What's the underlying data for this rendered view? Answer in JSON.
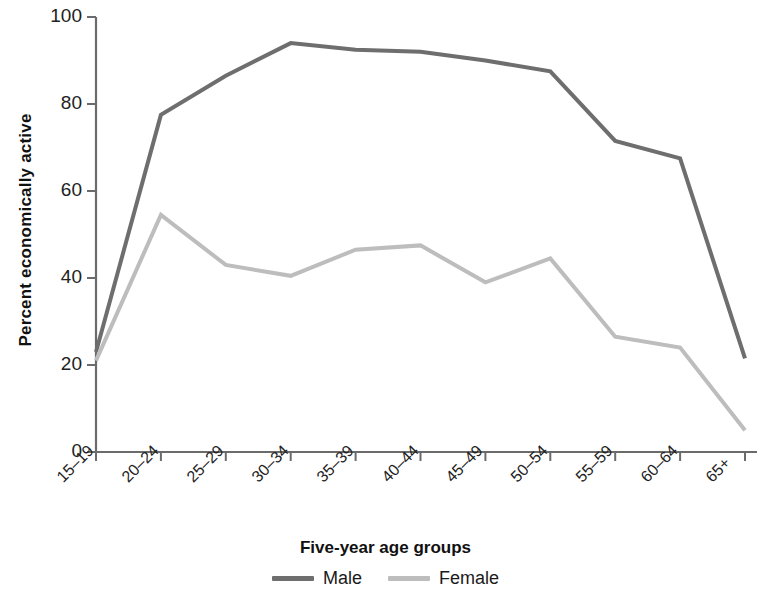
{
  "chart_data": {
    "type": "line",
    "title": "",
    "xlabel": "Five-year age groups",
    "ylabel": "Percent economically active",
    "categories": [
      "15–19",
      "20–24",
      "25–29",
      "30–34",
      "35–39",
      "40–44",
      "45–49",
      "50–54",
      "55–59",
      "60–64",
      "65+"
    ],
    "series": [
      {
        "name": "Male",
        "color": "#6e6e6e",
        "values": [
          23,
          77.5,
          86.5,
          94,
          92.5,
          92,
          90,
          87.5,
          71.5,
          67.5,
          21.5
        ]
      },
      {
        "name": "Female",
        "color": "#bdbdbd",
        "values": [
          21,
          54.5,
          43,
          40.5,
          46.5,
          47.5,
          39,
          44.5,
          26.5,
          24,
          5
        ]
      }
    ],
    "ylim": [
      0,
      100
    ],
    "yticks": [
      0,
      20,
      40,
      60,
      80,
      100
    ],
    "ytick_labels": [
      "0",
      "20",
      "40",
      "60",
      "80",
      "100"
    ],
    "grid": false,
    "legend_position": "bottom"
  },
  "axes": {
    "y_axis_title": "Percent economically active",
    "x_axis_title": "Five-year age groups"
  },
  "legend": {
    "entries": [
      {
        "label": "Male",
        "color": "#6e6e6e"
      },
      {
        "label": "Female",
        "color": "#bdbdbd"
      }
    ]
  }
}
